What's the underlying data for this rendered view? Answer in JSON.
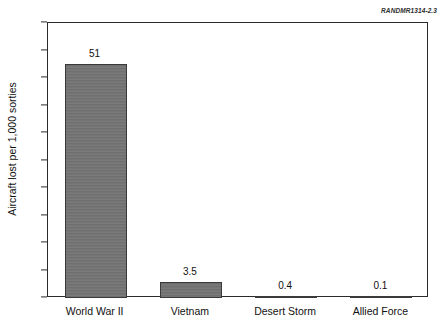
{
  "figure": {
    "report_id": "RANDMR1314-2.3",
    "background_color": "#ffffff",
    "frame_color": "#2b2b2b"
  },
  "chart_data": {
    "type": "bar",
    "title": "",
    "subtitle": "",
    "xlabel": "",
    "ylabel": "Aircraft lost per 1,000 sorties",
    "categories": [
      "World War II",
      "Vietnam",
      "Desert Storm",
      "Allied Force"
    ],
    "values": [
      51,
      3.5,
      0.4,
      0.1
    ],
    "value_labels": [
      "51",
      "3.5",
      "0.4",
      "0.1"
    ],
    "ylim": [
      0,
      60
    ],
    "yticks": [
      0,
      6,
      12,
      18,
      24,
      30,
      36,
      42,
      48,
      54,
      60
    ],
    "ytick_labels": [
      "0",
      "6",
      "12",
      "18",
      "24",
      "30",
      "36",
      "42",
      "48",
      "54",
      "60"
    ],
    "grid": false,
    "legend": null,
    "legend_position": "none",
    "bar_color": "#737373",
    "bar_edge_color": "#3a3a3a",
    "orientation": "vertical"
  }
}
